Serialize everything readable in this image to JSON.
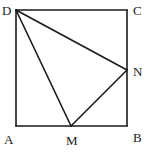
{
  "diagram": {
    "type": "geometry",
    "shape": "square ABCD with triangle DMN",
    "stroke_color": "#1a1a1a",
    "background": "#ffffff",
    "points": {
      "A": {
        "label": "A",
        "x": 16,
        "y": 126
      },
      "B": {
        "label": "B",
        "x": 127,
        "y": 126
      },
      "C": {
        "label": "C",
        "x": 127,
        "y": 10
      },
      "D": {
        "label": "D",
        "x": 16,
        "y": 10
      },
      "M": {
        "label": "M",
        "x": 71,
        "y": 126
      },
      "N": {
        "label": "N",
        "x": 127,
        "y": 70
      }
    },
    "segments": [
      [
        "A",
        "B"
      ],
      [
        "B",
        "C"
      ],
      [
        "C",
        "D"
      ],
      [
        "D",
        "A"
      ],
      [
        "D",
        "M"
      ],
      [
        "D",
        "N"
      ],
      [
        "M",
        "N"
      ]
    ],
    "labels": {
      "A": "A",
      "B": "B",
      "C": "C",
      "D": "D",
      "M": "M",
      "N": "N"
    }
  }
}
